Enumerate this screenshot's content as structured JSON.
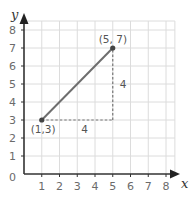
{
  "chart_data": {
    "type": "line",
    "title": "",
    "xlabel": "x",
    "ylabel": "y",
    "xlim": [
      0,
      8.5
    ],
    "ylim": [
      0,
      8.5
    ],
    "grid": true,
    "x_ticks": [
      "1",
      "2",
      "3",
      "4",
      "5",
      "6",
      "7",
      "8"
    ],
    "y_ticks": [
      "1",
      "2",
      "3",
      "4",
      "5",
      "6",
      "7",
      "8"
    ],
    "origin_label": "0",
    "series": [
      {
        "name": "segment",
        "points": [
          {
            "x": 1,
            "y": 3
          },
          {
            "x": 5,
            "y": 7
          }
        ],
        "color": "#6e6e6e"
      }
    ],
    "guides": [
      {
        "name": "horizontal-run",
        "from": {
          "x": 1,
          "y": 3
        },
        "to": {
          "x": 5,
          "y": 3
        },
        "style": "dashed",
        "label": "4"
      },
      {
        "name": "vertical-rise",
        "from": {
          "x": 5,
          "y": 3
        },
        "to": {
          "x": 5,
          "y": 7
        },
        "style": "dashed",
        "label": "4"
      }
    ],
    "annotations": [
      {
        "text": "(1,3)",
        "x": 1,
        "y": 3
      },
      {
        "text": "(5, 7)",
        "x": 5,
        "y": 7
      }
    ]
  },
  "colors": {
    "grid": "#dcdcdc",
    "axis": "#333333",
    "line": "#6e6e6e",
    "guide": "#777777",
    "point": "#444444"
  }
}
